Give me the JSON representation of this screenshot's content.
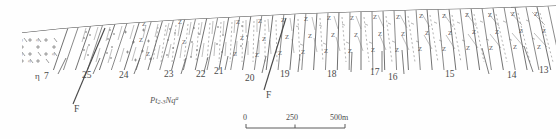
{
  "figure": {
    "kind": "geological-cross-section",
    "title": "",
    "surface_description": "topographic ground surface rising gently from left to right",
    "ink_color": "#4a4a4a",
    "background_color": "#ffffff"
  },
  "unit_labels": [
    {
      "id": "7",
      "text": "7",
      "x": 44,
      "y": 72
    },
    {
      "id": "25",
      "text": "25",
      "x": 82,
      "y": 71
    },
    {
      "id": "24",
      "text": "24",
      "x": 119,
      "y": 71
    },
    {
      "id": "23",
      "text": "23",
      "x": 164,
      "y": 70
    },
    {
      "id": "22",
      "text": "22",
      "x": 196,
      "y": 70
    },
    {
      "id": "21",
      "text": "21",
      "x": 214,
      "y": 67
    },
    {
      "id": "20",
      "text": "20",
      "x": 245,
      "y": 74
    },
    {
      "id": "19",
      "text": "19",
      "x": 280,
      "y": 70
    },
    {
      "id": "18",
      "text": "18",
      "x": 327,
      "y": 70
    },
    {
      "id": "17",
      "text": "17",
      "x": 370,
      "y": 68
    },
    {
      "id": "16",
      "text": "16",
      "x": 388,
      "y": 73
    },
    {
      "id": "15",
      "text": "15",
      "x": 445,
      "y": 70
    },
    {
      "id": "14",
      "text": "14",
      "x": 507,
      "y": 71
    },
    {
      "id": "13",
      "text": "13",
      "x": 539,
      "y": 66
    }
  ],
  "marker_label": {
    "text": "η",
    "x": 35,
    "y": 72
  },
  "fault_labels": [
    {
      "text": "F",
      "x": 74,
      "y": 108
    },
    {
      "text": "F",
      "x": 266,
      "y": 94
    }
  ],
  "formation_label": {
    "prefix": "Pt",
    "subscript": "2-3",
    "symbol": "Nq",
    "superscript": "a",
    "x": 150,
    "y": 98
  },
  "scale_bar": {
    "ticks": [
      "0",
      "250",
      "500m"
    ],
    "x_start": 246,
    "x_end": 345,
    "y": 128,
    "label_y": 116
  },
  "legend_notes": {
    "granite_pattern": "cross-and-slash granite ornament at far left",
    "schist_pattern": "Z-shaped metamorphic foliation symbols",
    "bedding_pattern": "steeply dipping bedding traces"
  }
}
